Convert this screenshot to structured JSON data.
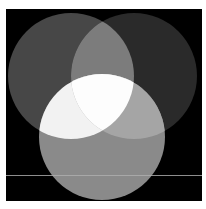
{
  "diagram": {
    "type": "three-circle-venn",
    "background_color": "#ffffff",
    "panel": {
      "x": 6,
      "y": 9,
      "width": 196,
      "height": 192,
      "color": "#000000"
    },
    "circles": [
      {
        "id": "left",
        "cx": 71,
        "cy": 76,
        "r": 63,
        "color": "#474747"
      },
      {
        "id": "right",
        "cx": 134,
        "cy": 76,
        "r": 63,
        "color": "#2a2a2a"
      },
      {
        "id": "bottom",
        "cx": 102,
        "cy": 137,
        "r": 63,
        "color": "#8a8a8a"
      }
    ],
    "overlaps": {
      "left_right": "#7c7c7c",
      "left_bottom": "#f2f2f2",
      "right_bottom": "#a5a5a5",
      "all_three": "#fdfdfd"
    },
    "rule_line": {
      "y": 175,
      "x1": 6,
      "x2": 202,
      "color_on_black": "#8e8e8e",
      "color_on_circle": "#a8a8a8"
    }
  }
}
